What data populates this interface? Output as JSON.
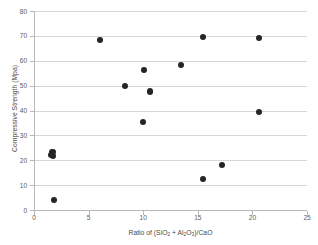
{
  "chart_data": {
    "type": "scatter",
    "title": "",
    "xlabel": "Ratio of (SiO2 + Al2O3)/CaO",
    "ylabel": "Compressive Strength (Mpa)",
    "xlim": [
      0,
      25
    ],
    "ylim": [
      0,
      80
    ],
    "xticks": [
      0,
      5,
      10,
      15,
      20,
      25
    ],
    "yticks": [
      0,
      10,
      20,
      30,
      40,
      50,
      60,
      70,
      80
    ],
    "grid": "horizontal",
    "legend": "none",
    "marker": "filled-circle",
    "marker_color": "#252525",
    "points": [
      {
        "x": 1.55,
        "y": 22.0
      },
      {
        "x": 1.7,
        "y": 23.2
      },
      {
        "x": 1.75,
        "y": 21.6
      },
      {
        "x": 1.85,
        "y": 4.0
      },
      {
        "x": 6.05,
        "y": 68.5
      },
      {
        "x": 8.35,
        "y": 49.9
      },
      {
        "x": 9.95,
        "y": 35.4
      },
      {
        "x": 10.05,
        "y": 56.4
      },
      {
        "x": 10.6,
        "y": 47.6
      },
      {
        "x": 13.45,
        "y": 58.3
      },
      {
        "x": 15.45,
        "y": 69.7
      },
      {
        "x": 15.5,
        "y": 12.5
      },
      {
        "x": 17.25,
        "y": 18.2
      },
      {
        "x": 20.6,
        "y": 69.2
      },
      {
        "x": 20.6,
        "y": 39.4
      }
    ]
  },
  "axis": {
    "x_title_parts": {
      "pre": "Ratio of (SiO",
      "sub1": "2",
      "mid": " + Al",
      "sub2": "2",
      "mid2": "O",
      "sub3": "3",
      "post": ")/CaO"
    },
    "y_title": "Compressive Strength (Mpa)"
  },
  "colors": {
    "gridline": "#d6d6d6",
    "axis": "#b8b8b8",
    "marker": "#252525",
    "tick_text": "#5a5a5a",
    "background": "#ffffff"
  }
}
